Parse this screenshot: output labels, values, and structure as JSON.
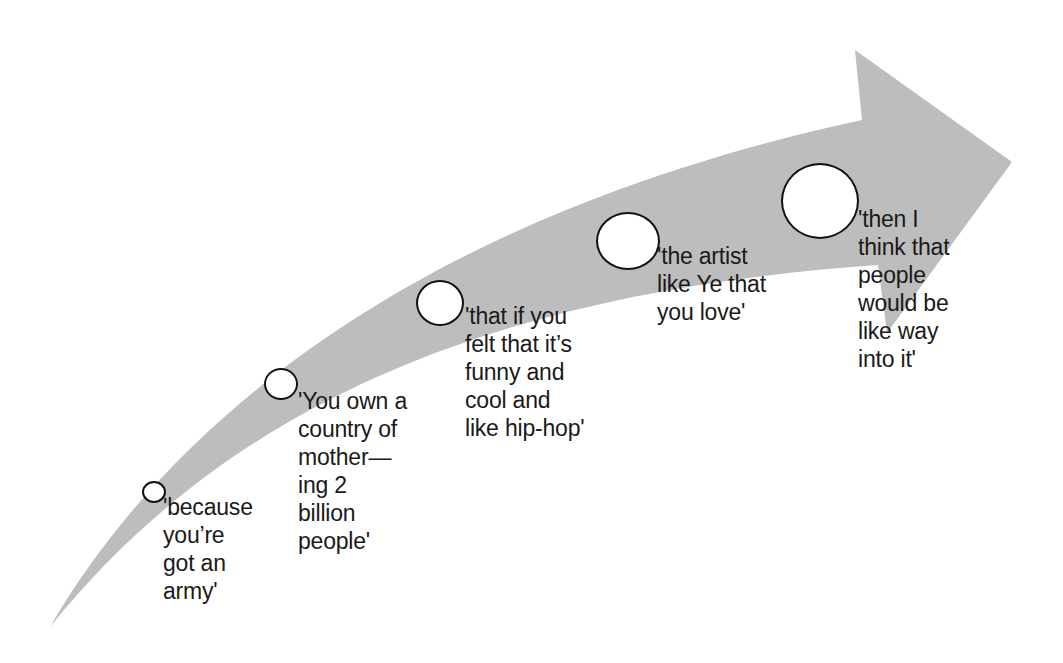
{
  "diagram": {
    "type": "curved-progress-arrow",
    "arrow_color": "#bdbdbd",
    "steps": [
      {
        "id": 1,
        "text": "'because\nyou’re\ngot an\narmy'",
        "circle_size": "smallest"
      },
      {
        "id": 2,
        "text": "'You own a\ncountry of\nmother—\ning 2\nbillion\npeople'",
        "circle_size": "small"
      },
      {
        "id": 3,
        "text": "'that if you\nfelt that it’s\nfunny and\ncool and\nlike hip-hop'",
        "circle_size": "medium"
      },
      {
        "id": 4,
        "text": "'the artist\nlike Ye that\nyou love'",
        "circle_size": "large"
      },
      {
        "id": 5,
        "text": "'then I\nthink that\npeople\nwould be\nlike way\ninto it'",
        "circle_size": "largest"
      }
    ]
  }
}
